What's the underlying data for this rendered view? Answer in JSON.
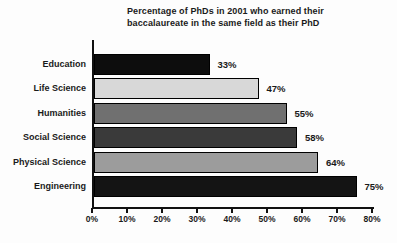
{
  "title": {
    "line1": "Percentage of PhDs in 2001 who earned their",
    "line2": "baccalaureate in the same field as their PhD"
  },
  "chart_data": {
    "type": "bar",
    "orientation": "horizontal",
    "title": "Percentage of PhDs in 2001 who earned their baccalaureate in the same field as their PhD",
    "categories": [
      "Education",
      "Life Science",
      "Humanities",
      "Social Science",
      "Physical Science",
      "Engineering"
    ],
    "values": [
      33,
      47,
      55,
      58,
      64,
      75
    ],
    "value_labels": [
      "33%",
      "47%",
      "55%",
      "58%",
      "64%",
      "75%"
    ],
    "bar_colors": [
      "#0d0d0d",
      "#d8d8d8",
      "#707070",
      "#3a3a3a",
      "#9c9c9c",
      "#141414"
    ],
    "bar_border_color": "#000000",
    "xlabel": "",
    "ylabel": "",
    "xlim": [
      0,
      80
    ],
    "xticks": [
      0,
      10,
      20,
      30,
      40,
      50,
      60,
      70,
      80
    ],
    "xtick_labels": [
      "0%",
      "10%",
      "20%",
      "30%",
      "40%",
      "50%",
      "60%",
      "70%",
      "80%"
    ],
    "grid": false,
    "legend": false,
    "axis_color": "#111111",
    "text_color": "#1a1a1a"
  }
}
